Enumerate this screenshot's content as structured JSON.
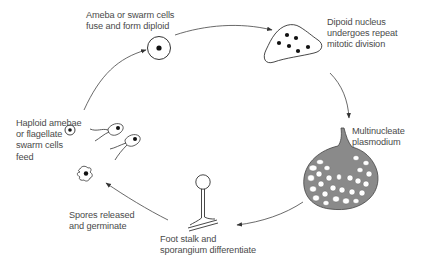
{
  "diagram": {
    "type": "cycle",
    "stages": [
      {
        "id": "fuse",
        "label": "Ameba or swarm cells\nfuse and form diploid"
      },
      {
        "id": "mitosis",
        "label": "Dipoid nucleus\nundergoes repeat\nmitotic division"
      },
      {
        "id": "plasmodium",
        "label": "Multinucleate\nplasmodium"
      },
      {
        "id": "sporangium",
        "label": "Foot stalk and\nsporangium differentiate"
      },
      {
        "id": "spores",
        "label": "Spores released\nand germinate"
      },
      {
        "id": "haploid",
        "label": "Haploid amebae\nor flagellate\nswarm cells\nfeed"
      }
    ],
    "arrows": [
      {
        "from": "haploid",
        "to": "fuse"
      },
      {
        "from": "fuse",
        "to": "mitosis"
      },
      {
        "from": "mitosis",
        "to": "plasmodium"
      },
      {
        "from": "plasmodium",
        "to": "sporangium"
      },
      {
        "from": "sporangium",
        "to": "spores"
      }
    ],
    "colors": {
      "line": "#333333",
      "text": "#4a4a4a",
      "plasmodium_fill": "#8a8a8a",
      "background": "#ffffff"
    }
  }
}
